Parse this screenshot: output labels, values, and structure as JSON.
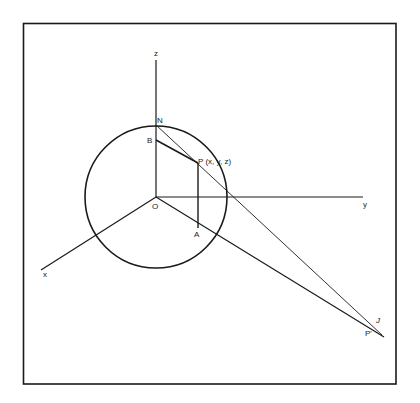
{
  "figure": {
    "colors": {
      "ink": "#1a1a1a",
      "background": "#ffffff"
    }
  },
  "axes": {
    "x_label": "x",
    "y_label": "y",
    "z_label": "z"
  },
  "points": {
    "north_pole": "N",
    "b_point": "B",
    "p_point": "P (x, y, z)",
    "origin": "O",
    "a_point": "A",
    "projected_point": "P'",
    "tick_mark": "J"
  },
  "geometry": {
    "frame": {
      "x1": 23,
      "y1": 23,
      "x2": 396,
      "y2": 384
    },
    "sphere": {
      "cx": 156,
      "cy": 197,
      "r": 71
    },
    "origin": [
      156,
      197
    ],
    "N": [
      156,
      125
    ],
    "B": [
      156,
      140
    ],
    "P": [
      198,
      163
    ],
    "A": [
      198,
      228
    ],
    "P_prime": [
      374,
      330
    ]
  }
}
